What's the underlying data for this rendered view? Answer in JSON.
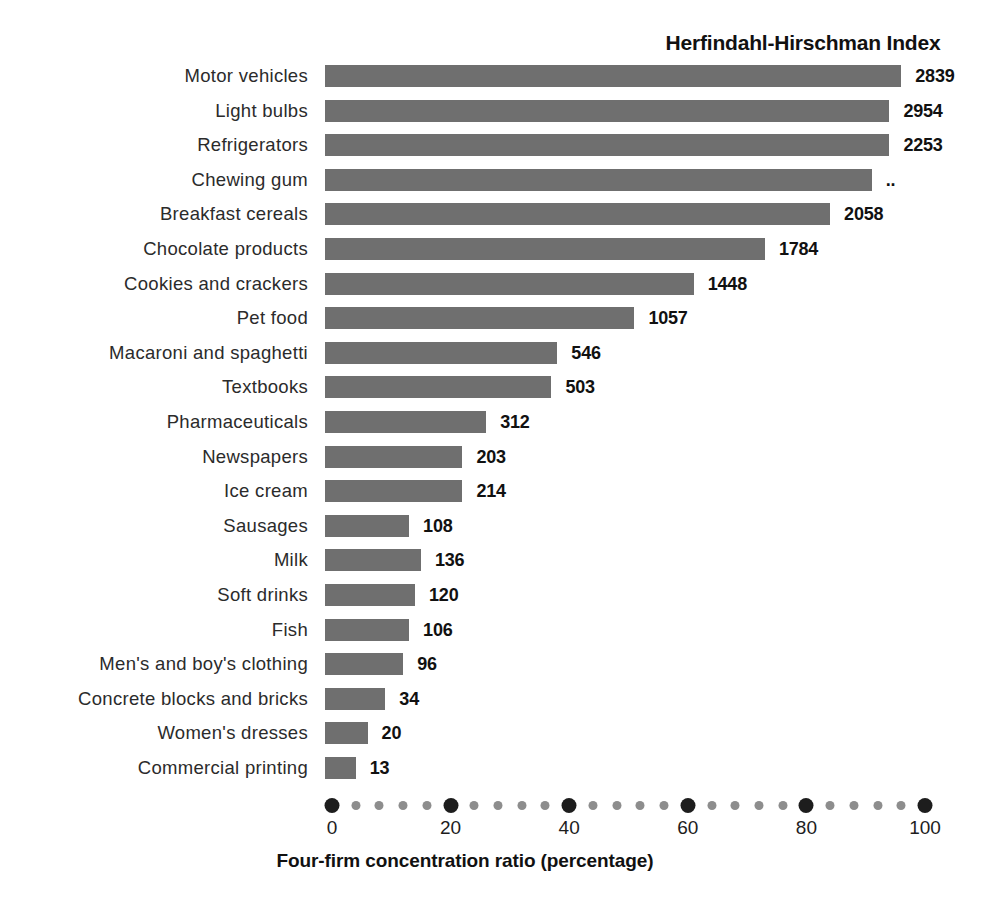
{
  "chart_data": {
    "type": "bar",
    "orientation": "horizontal",
    "title": "Herfindahl-Hirschman Index",
    "xlabel": "Four-firm concentration ratio (percentage)",
    "ylabel": "",
    "xlim": [
      0,
      100
    ],
    "xticks": [
      0,
      20,
      40,
      60,
      80,
      100
    ],
    "xtick_labels": [
      "0",
      "20",
      "40",
      "60",
      "80",
      "100"
    ],
    "minor_ticks_between_majors": 4,
    "grid": false,
    "legend": null,
    "bar_color": "#6f6f6f",
    "text_color": "#1a1a1a",
    "categories": [
      "Motor vehicles",
      "Light bulbs",
      "Refrigerators",
      "Chewing gum",
      "Breakfast cereals",
      "Chocolate products",
      "Cookies and crackers",
      "Pet food",
      "Macaroni and spaghetti",
      "Textbooks",
      "Pharmaceuticals",
      "Newspapers",
      "Ice cream",
      "Sausages",
      "Milk",
      "Soft drinks",
      "Fish",
      "Men's and boy's clothing",
      "Concrete blocks and bricks",
      "Women's dresses",
      "Commercial printing"
    ],
    "values": [
      96,
      94,
      94,
      91,
      84,
      73,
      61,
      51,
      38,
      37,
      26,
      22,
      22,
      13,
      15,
      14,
      13,
      12,
      9,
      6,
      4
    ],
    "value_labels": [
      "2839",
      "2954",
      "2253",
      "..",
      "2058",
      "1784",
      "1448",
      "1057",
      "546",
      "503",
      "312",
      "203",
      "214",
      "108",
      "136",
      "120",
      "106",
      "96",
      "34",
      "20",
      "13"
    ],
    "series": [
      {
        "name": "Four-firm concentration ratio (percentage)",
        "values": [
          96,
          94,
          94,
          91,
          84,
          73,
          61,
          51,
          38,
          37,
          26,
          22,
          22,
          13,
          15,
          14,
          13,
          12,
          9,
          6,
          4
        ]
      },
      {
        "name": "Herfindahl-Hirschman Index",
        "values": [
          2839,
          2954,
          2253,
          null,
          2058,
          1784,
          1448,
          1057,
          546,
          503,
          312,
          203,
          214,
          108,
          136,
          120,
          106,
          96,
          34,
          20,
          13
        ]
      }
    ]
  }
}
